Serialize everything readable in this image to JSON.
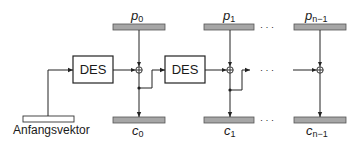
{
  "diagram": {
    "type": "CBC encryption mode block diagram",
    "iv_label": "Anfangsvektor",
    "cipher_blocks": [
      {
        "label": "DES"
      },
      {
        "label": "DES"
      }
    ],
    "plaintext": [
      {
        "base": "p",
        "sub": "0"
      },
      {
        "base": "p",
        "sub": "1"
      },
      {
        "base": "p",
        "sub": "n−1"
      }
    ],
    "ciphertext": [
      {
        "base": "c",
        "sub": "0"
      },
      {
        "base": "c",
        "sub": "1"
      },
      {
        "base": "c",
        "sub": "n−1"
      }
    ],
    "ellipsis": "· · ·",
    "xor_symbol": "⊕",
    "colors": {
      "bar_fill": "#a6a6a6",
      "bar_stroke": "#555555",
      "line": "#222222",
      "box_stroke": "#222222"
    }
  }
}
